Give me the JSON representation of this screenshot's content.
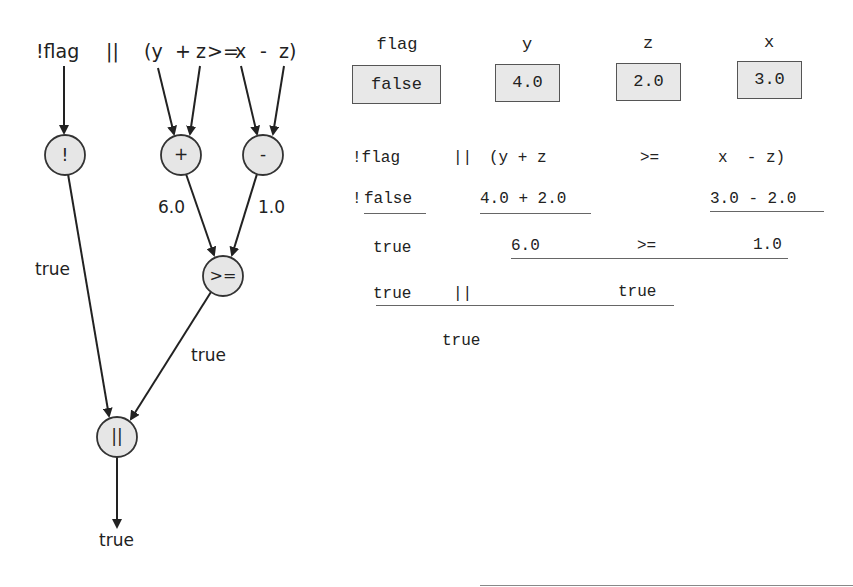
{
  "expression_tree": {
    "source_tokens": [
      "!flag",
      "||",
      "(y",
      "+",
      "z",
      ">=",
      "x",
      "-",
      "z)"
    ],
    "nodes": [
      {
        "id": "not",
        "label": "!"
      },
      {
        "id": "plus",
        "label": "+"
      },
      {
        "id": "minus",
        "label": "-"
      },
      {
        "id": "gte",
        "label": ">="
      },
      {
        "id": "or",
        "label": "||"
      }
    ],
    "edge_labels": {
      "plus_out": "6.0",
      "minus_out": "1.0",
      "not_out": "true",
      "gte_out": "true",
      "or_out": "true"
    }
  },
  "variables": [
    {
      "name": "flag",
      "value": "false"
    },
    {
      "name": "y",
      "value": "4.0"
    },
    {
      "name": "z",
      "value": "2.0"
    },
    {
      "name": "x",
      "value": "3.0"
    }
  ],
  "evaluation_steps": {
    "step1": {
      "not_flag": "!flag",
      "or": "||",
      "lhs": "(y + z",
      "op": ">=",
      "rhs": "x  - z)"
    },
    "step2": {
      "not": "!",
      "flag_val": "false",
      "sum": "4.0 + 2.0",
      "diff": "3.0 - 2.0"
    },
    "step3": {
      "left": "true",
      "sum_val": "6.0",
      "op": ">=",
      "diff_val": "1.0"
    },
    "step4": {
      "left": "true",
      "or": "||",
      "right": "true"
    },
    "step5": {
      "result": "true"
    }
  },
  "colors": {
    "node_fill": "#e6e6e6",
    "node_stroke": "#333333",
    "box_fill": "#e8e8e8",
    "text": "#222222"
  }
}
